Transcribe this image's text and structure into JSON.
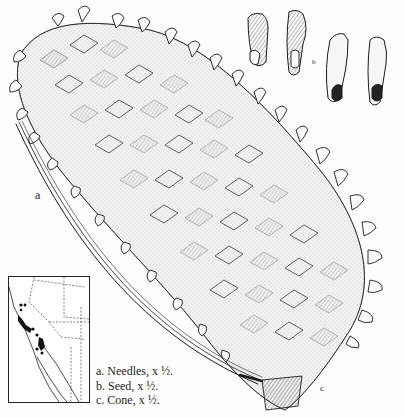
{
  "plate": {
    "header_cut_text": "· · · · ·",
    "labels": {
      "needle_label": "a",
      "seed_label": "b",
      "cone_label": "c"
    },
    "legend": [
      {
        "letter": "a.",
        "text": "Needles, x ½."
      },
      {
        "letter": "b.",
        "text": "Seed, x ½."
      },
      {
        "letter": "c.",
        "text": "Cone, x ½."
      }
    ],
    "map": {
      "title": "Range map",
      "region": "California and Baja California"
    },
    "colors": {
      "ink": "#1a1a1a",
      "paper": "#fdfdfc"
    }
  }
}
